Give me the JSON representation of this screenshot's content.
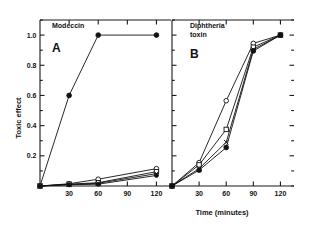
{
  "figure": {
    "background": "#ffffff",
    "ink_color": "#111111",
    "axis_title_x": "Time (minutes)",
    "axis_title_y": "Toxic effect"
  },
  "chart_data": [
    {
      "type": "line",
      "panel_letter": "A",
      "title": "Modeccin",
      "xlabel": "Time (minutes)",
      "ylabel": "Toxic effect",
      "xlim": [
        0,
        135
      ],
      "ylim": [
        0,
        1.1
      ],
      "xticks": [
        30,
        60,
        90,
        120
      ],
      "xticklabels": [
        "30",
        "60",
        "90",
        "120"
      ],
      "yticks": [
        0.2,
        0.4,
        0.6,
        0.8,
        1.0
      ],
      "yticklabels": [
        "0.2",
        "0.4",
        "0.6",
        "0.8",
        "1.0"
      ],
      "grid": false,
      "legend": "none",
      "x": [
        0,
        30,
        60,
        120
      ],
      "series": [
        {
          "name": "control",
          "marker": "filled-circle",
          "values": [
            0.0,
            0.6,
            1.0,
            1.0
          ]
        },
        {
          "name": "treated-1",
          "marker": "open-circle",
          "values": [
            0.0,
            0.015,
            0.045,
            0.115
          ]
        },
        {
          "name": "treated-2",
          "marker": "open-square",
          "values": [
            0.0,
            0.012,
            0.022,
            0.095
          ]
        },
        {
          "name": "treated-3",
          "marker": "cross",
          "values": [
            0.0,
            0.01,
            0.018,
            0.082
          ]
        },
        {
          "name": "treated-4",
          "marker": "filled-circle-small",
          "values": [
            0.0,
            0.008,
            0.012,
            0.07
          ]
        }
      ]
    },
    {
      "type": "line",
      "panel_letter": "B",
      "title": "Diphtheria toxin",
      "title_line1": "Diphtheria",
      "title_line2": "toxin",
      "xlabel": "Time (minutes)",
      "ylabel": "Toxic effect",
      "xlim": [
        0,
        135
      ],
      "ylim": [
        0,
        1.1
      ],
      "xticks": [
        30,
        60,
        90,
        120
      ],
      "xticklabels": [
        "30",
        "60",
        "90",
        "120"
      ],
      "yticks": [
        0.2,
        0.4,
        0.6,
        0.8,
        1.0
      ],
      "yticklabels": [],
      "grid": false,
      "legend": "none",
      "x": [
        0,
        30,
        60,
        90,
        120
      ],
      "series": [
        {
          "name": "series-open-circle",
          "marker": "open-circle",
          "values": [
            0.0,
            0.155,
            0.565,
            0.945,
            1.0
          ]
        },
        {
          "name": "series-open-square",
          "marker": "open-square",
          "values": [
            0.0,
            0.14,
            0.375,
            0.92,
            1.0
          ]
        },
        {
          "name": "series-cross",
          "marker": "cross",
          "values": [
            0.0,
            0.115,
            0.29,
            0.905,
            1.0
          ]
        },
        {
          "name": "series-filled-circle",
          "marker": "filled-circle",
          "values": [
            0.0,
            0.105,
            0.255,
            0.895,
            1.0
          ]
        }
      ]
    }
  ]
}
